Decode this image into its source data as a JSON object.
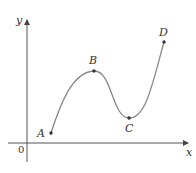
{
  "diagram": {
    "axes": {
      "x_label": "x",
      "y_label": "y",
      "origin_label": "0",
      "axis_color": "#555555"
    },
    "curve_color": "#777777",
    "point_color": "#333333",
    "points": [
      {
        "label": "A",
        "x": 51,
        "y": 133,
        "label_x": 38,
        "label_y": 137
      },
      {
        "label": "B",
        "x": 94,
        "y": 71,
        "label_x": 90,
        "label_y": 64
      },
      {
        "label": "C",
        "x": 129,
        "y": 118,
        "label_x": 125,
        "label_y": 131
      },
      {
        "label": "D",
        "x": 164,
        "y": 42,
        "label_x": 159,
        "label_y": 35
      }
    ]
  }
}
